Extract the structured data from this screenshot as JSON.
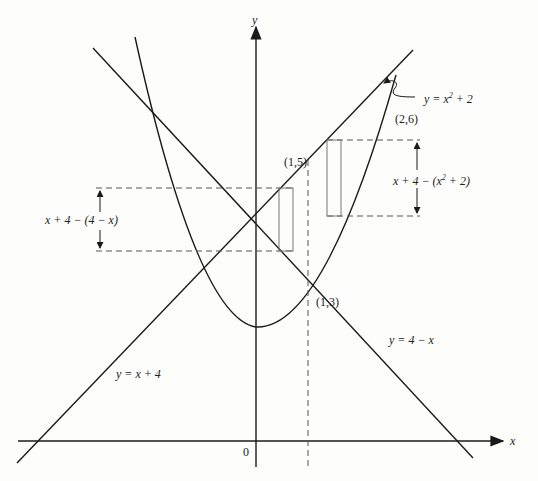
{
  "diagram": {
    "type": "region-between-curves",
    "axes": {
      "x_label": "x",
      "y_label": "y",
      "origin_label": "0"
    },
    "curves": [
      {
        "id": "parabola",
        "label_y": "y = ",
        "label_base": "x",
        "label_exp": "2",
        "label_tail": " + 2"
      },
      {
        "id": "line-rising",
        "label": "y = x + 4"
      },
      {
        "id": "line-falling",
        "label": "y = 4 − x"
      }
    ],
    "points": [
      {
        "label": "(1,5)"
      },
      {
        "label": "(1,3)"
      },
      {
        "label": "(2,6)"
      }
    ],
    "heights": {
      "left": "x + 4 − (4 − x)",
      "right_prefix": "x + 4 − (",
      "right_base": "x",
      "right_exp": "2",
      "right_suffix": " + 2)"
    },
    "colors": {
      "ink": "#1a1a1a",
      "dashed": "#555555",
      "rect": "#777777",
      "background": "#fdfdfb"
    }
  }
}
